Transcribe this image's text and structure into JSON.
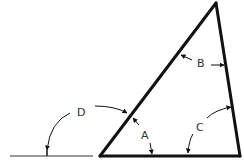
{
  "diagram": {
    "type": "triangle-angle-labels",
    "colors": {
      "stroke": "#111111",
      "label": "#333333",
      "background": "#ffffff"
    },
    "labels": {
      "a": "A",
      "b": "B",
      "c": "C",
      "d": "D"
    }
  }
}
